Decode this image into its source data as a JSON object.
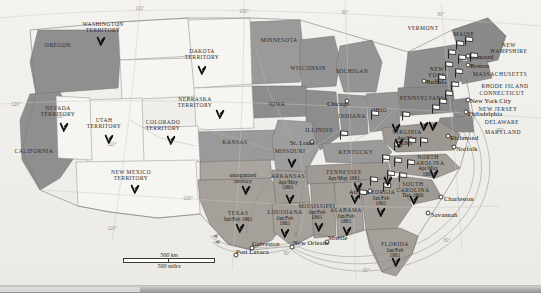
{
  "map": {
    "title": "United States Secession Map 1860-1861",
    "scale": {
      "km_label": "500 km",
      "miles_label": "500 miles"
    },
    "graticule": [
      {
        "label": "110°",
        "x": 140,
        "y": 8
      },
      {
        "label": "100°",
        "x": 244,
        "y": 11
      },
      {
        "label": "90°",
        "x": 345,
        "y": 12
      },
      {
        "label": "80°",
        "x": 441,
        "y": 14
      },
      {
        "label": "120°",
        "x": 16,
        "y": 104
      },
      {
        "label": "120°",
        "x": 60,
        "y": 116
      },
      {
        "label": "110°",
        "x": 112,
        "y": 144
      },
      {
        "label": "40°",
        "x": 302,
        "y": 183
      },
      {
        "label": "100°",
        "x": 188,
        "y": 198
      },
      {
        "label": "40°",
        "x": 468,
        "y": 117
      },
      {
        "label": "30°",
        "x": 500,
        "y": 130
      },
      {
        "label": "90°",
        "x": 287,
        "y": 253
      },
      {
        "label": "30°",
        "x": 366,
        "y": 270
      },
      {
        "label": "80°",
        "x": 447,
        "y": 240
      },
      {
        "label": "110°",
        "x": 112,
        "y": 228
      }
    ],
    "states": [
      {
        "name": "OREGON",
        "x": 58,
        "y": 46,
        "cls": "state"
      },
      {
        "name": "WASHINGTON\nTERRITORY",
        "x": 103,
        "y": 28,
        "cls": "terr"
      },
      {
        "name": "DAKOTA\nTERRITORY",
        "x": 202,
        "y": 55,
        "cls": "terr"
      },
      {
        "name": "MINNESOTA",
        "x": 279,
        "y": 41,
        "cls": "state"
      },
      {
        "name": "WISCONSIN",
        "x": 308,
        "y": 69,
        "cls": "state"
      },
      {
        "name": "MICHIGAN",
        "x": 352,
        "y": 72,
        "cls": "state"
      },
      {
        "name": "MAINE",
        "x": 464,
        "y": 35,
        "cls": "state"
      },
      {
        "name": "VERMONT",
        "x": 423,
        "y": 29,
        "cls": "state"
      },
      {
        "name": "NEW\nHAMPSHIRE",
        "x": 509,
        "y": 49,
        "cls": "state"
      },
      {
        "name": "MASSACHUSETTS",
        "x": 500,
        "y": 75,
        "cls": "state"
      },
      {
        "name": "RHODE ISLAND",
        "x": 505,
        "y": 87,
        "cls": "state"
      },
      {
        "name": "CONNECTICUT",
        "x": 502,
        "y": 94,
        "cls": "state"
      },
      {
        "name": "NEW\nYORK",
        "x": 437,
        "y": 73,
        "cls": "state"
      },
      {
        "name": "NEW JERSEY",
        "x": 498,
        "y": 110,
        "cls": "state"
      },
      {
        "name": "PENNSYLVANIA",
        "x": 424,
        "y": 99,
        "cls": "state"
      },
      {
        "name": "DELAWARE",
        "x": 502,
        "y": 123,
        "cls": "state"
      },
      {
        "name": "MARYLAND",
        "x": 503,
        "y": 133,
        "cls": "state"
      },
      {
        "name": "OHIO",
        "x": 379,
        "y": 111,
        "cls": "state"
      },
      {
        "name": "INDIANA",
        "x": 352,
        "y": 117,
        "cls": "state"
      },
      {
        "name": "ILLINOIS",
        "x": 319,
        "y": 131,
        "cls": "state"
      },
      {
        "name": "IOWA",
        "x": 277,
        "y": 105,
        "cls": "state"
      },
      {
        "name": "MISSOURI",
        "x": 290,
        "y": 152,
        "cls": "state"
      },
      {
        "name": "KANSAS",
        "x": 235,
        "y": 143,
        "cls": "state"
      },
      {
        "name": "NEBRASKA\nTERRITORY",
        "x": 195,
        "y": 103,
        "cls": "terr"
      },
      {
        "name": "COLORADO\nTERRITORY",
        "x": 163,
        "y": 126,
        "cls": "terr"
      },
      {
        "name": "UTAH\nTERRITORY",
        "x": 104,
        "y": 124,
        "cls": "terr"
      },
      {
        "name": "NEVADA\nTERRITORY",
        "x": 58,
        "y": 112,
        "cls": "terr"
      },
      {
        "name": "CALIFORNIA",
        "x": 34,
        "y": 152,
        "cls": "state"
      },
      {
        "name": "NEW MEXICO\nTERRITORY",
        "x": 131,
        "y": 176,
        "cls": "terr"
      },
      {
        "name": "KENTUCKY",
        "x": 356,
        "y": 153,
        "cls": "state"
      }
    ],
    "unorganized": {
      "label": "unorganized\nterritory",
      "x": 243,
      "y": 178
    },
    "seceded": [
      {
        "name": "TEXAS",
        "date": "Jan/Feb 1861",
        "x": 238,
        "y": 216
      },
      {
        "name": "LOUISIANA",
        "date": "Jan/Feb\n1861",
        "x": 285,
        "y": 218
      },
      {
        "name": "ARKANSAS",
        "date": "Apr/May\n1861",
        "x": 288,
        "y": 182
      },
      {
        "name": "MISSISSIPPI",
        "date": "Jan/Feb\n1861",
        "x": 317,
        "y": 212
      },
      {
        "name": "ALABAMA",
        "date": "Jan/Feb\n1861",
        "x": 346,
        "y": 216
      },
      {
        "name": "TENNESSEE",
        "date": "Apr/May 1861",
        "x": 344,
        "y": 175
      },
      {
        "name": "GEORGIA",
        "date": "Jan/Feb\n1861",
        "x": 381,
        "y": 198
      },
      {
        "name": "FLORIDA",
        "date": "Jan/Feb\n1861",
        "x": 395,
        "y": 250
      },
      {
        "name": "SOUTH\nCAROLINA",
        "date": "Dec 1860",
        "x": 413,
        "y": 190
      },
      {
        "name": "NORTH\nCAROLINA",
        "date": "Apr/May\n1861",
        "x": 428,
        "y": 166
      },
      {
        "name": "VIRGINIA",
        "date": "Apr/May\n1861",
        "x": 407,
        "y": 138
      }
    ],
    "cities": [
      {
        "name": "Chicago",
        "x": 327,
        "y": 104,
        "px": 347,
        "py": 101,
        "align": "left"
      },
      {
        "name": "St. Louis",
        "x": 290,
        "y": 143,
        "px": 312,
        "py": 142,
        "align": "left"
      },
      {
        "name": "Atlanta",
        "x": 349,
        "y": 192,
        "px": 370,
        "py": 191,
        "align": "left"
      },
      {
        "name": "Mobile",
        "x": 328,
        "y": 238,
        "px": 327,
        "py": 242,
        "align": "left"
      },
      {
        "name": "New Orleans",
        "x": 293,
        "y": 243,
        "px": 292,
        "py": 247,
        "align": "left"
      },
      {
        "name": "Galveston",
        "x": 252,
        "y": 244,
        "px": 252,
        "py": 248,
        "align": "left"
      },
      {
        "name": "Port Lavaca",
        "x": 236,
        "y": 252,
        "px": 236,
        "py": 255,
        "align": "left"
      },
      {
        "name": "Charleston",
        "x": 444,
        "y": 199,
        "px": 441,
        "py": 197,
        "align": "left"
      },
      {
        "name": "Savannah",
        "x": 431,
        "y": 215,
        "px": 428,
        "py": 213,
        "align": "left"
      },
      {
        "name": "Norfolk",
        "x": 456,
        "y": 149,
        "px": 454,
        "py": 147,
        "align": "left"
      },
      {
        "name": "Richmond",
        "x": 450,
        "y": 138,
        "px": 448,
        "py": 136,
        "align": "left"
      },
      {
        "name": "Philadelphia",
        "x": 468,
        "y": 114,
        "px": 466,
        "py": 112,
        "align": "left"
      },
      {
        "name": "New York City",
        "x": 470,
        "y": 101,
        "px": 468,
        "py": 100,
        "align": "left"
      },
      {
        "name": "Boston",
        "x": 470,
        "y": 66,
        "px": 468,
        "py": 65,
        "align": "left"
      },
      {
        "name": "Concord",
        "x": 470,
        "y": 57,
        "px": 468,
        "py": 56,
        "align": "left"
      },
      {
        "name": "Buffalo",
        "x": 426,
        "y": 82,
        "px": 424,
        "py": 81,
        "align": "left"
      }
    ],
    "flags": [
      {
        "x": 460,
        "y": 54
      },
      {
        "x": 469,
        "y": 50
      },
      {
        "x": 452,
        "y": 63
      },
      {
        "x": 462,
        "y": 68
      },
      {
        "x": 474,
        "y": 66
      },
      {
        "x": 449,
        "y": 75
      },
      {
        "x": 459,
        "y": 82
      },
      {
        "x": 442,
        "y": 88
      },
      {
        "x": 455,
        "y": 95
      },
      {
        "x": 449,
        "y": 104
      },
      {
        "x": 443,
        "y": 112
      },
      {
        "x": 436,
        "y": 118
      },
      {
        "x": 406,
        "y": 125
      },
      {
        "x": 375,
        "y": 124
      },
      {
        "x": 344,
        "y": 144
      },
      {
        "x": 398,
        "y": 155
      },
      {
        "x": 412,
        "y": 151
      },
      {
        "x": 424,
        "y": 151
      },
      {
        "x": 386,
        "y": 168
      },
      {
        "x": 398,
        "y": 171
      },
      {
        "x": 411,
        "y": 173
      },
      {
        "x": 391,
        "y": 184
      },
      {
        "x": 403,
        "y": 186
      },
      {
        "x": 374,
        "y": 190
      },
      {
        "x": 387,
        "y": 196
      },
      {
        "x": 363,
        "y": 203
      }
    ],
    "pins": [
      {
        "x": 101,
        "y": 41
      },
      {
        "x": 202,
        "y": 70
      },
      {
        "x": 220,
        "y": 114
      },
      {
        "x": 171,
        "y": 140
      },
      {
        "x": 109,
        "y": 139
      },
      {
        "x": 64,
        "y": 127
      },
      {
        "x": 135,
        "y": 189
      },
      {
        "x": 246,
        "y": 190
      },
      {
        "x": 240,
        "y": 228
      },
      {
        "x": 292,
        "y": 163
      },
      {
        "x": 290,
        "y": 199
      },
      {
        "x": 285,
        "y": 233
      },
      {
        "x": 319,
        "y": 227
      },
      {
        "x": 347,
        "y": 231
      },
      {
        "x": 355,
        "y": 199
      },
      {
        "x": 381,
        "y": 212
      },
      {
        "x": 396,
        "y": 262
      },
      {
        "x": 399,
        "y": 143
      },
      {
        "x": 434,
        "y": 174
      },
      {
        "x": 414,
        "y": 200
      },
      {
        "x": 388,
        "y": 181
      },
      {
        "x": 358,
        "y": 187
      },
      {
        "x": 424,
        "y": 126
      },
      {
        "x": 433,
        "y": 126
      },
      {
        "x": 396,
        "y": 128
      }
    ]
  }
}
